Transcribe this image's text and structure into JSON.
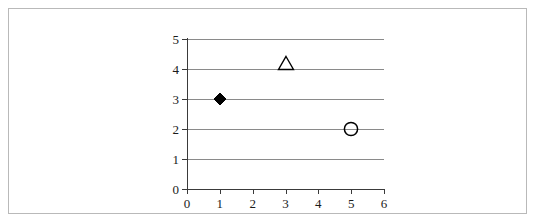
{
  "chart_data": {
    "type": "scatter",
    "title": "",
    "xlabel": "",
    "ylabel": "",
    "xlim": [
      0,
      6
    ],
    "ylim": [
      0,
      5
    ],
    "x_ticks": [
      0,
      1,
      2,
      3,
      4,
      5,
      6
    ],
    "y_ticks": [
      0,
      1,
      2,
      3,
      4,
      5
    ],
    "x_tick_labels": [
      "0",
      "1",
      "2",
      "3",
      "4",
      "5",
      "6"
    ],
    "y_tick_labels": [
      "0",
      "1",
      "2",
      "3",
      "4",
      "5"
    ],
    "grid": {
      "horizontal": true,
      "vertical": false,
      "horizontal_values": [
        1,
        2,
        3,
        4,
        5
      ],
      "color": "#8a8a8a"
    },
    "legend": null,
    "legend_position": "none",
    "axis_color": "#3a3a3a",
    "points": [
      {
        "label": "diamond-point",
        "x": 1,
        "y": 3,
        "marker": "filled-diamond",
        "color": "#000000",
        "filled": true
      },
      {
        "label": "triangle-point",
        "x": 3,
        "y": 4,
        "marker": "open-triangle",
        "color": "#000000",
        "filled": false
      },
      {
        "label": "circle-point",
        "x": 5,
        "y": 2,
        "marker": "open-circle",
        "color": "#000000",
        "filled": false
      }
    ],
    "series": [
      {
        "name": "points",
        "x": [
          1,
          3,
          5
        ],
        "values": [
          3,
          4,
          2
        ]
      }
    ]
  },
  "frame": {
    "border_color": "#b9b9b9",
    "background": "#ffffff"
  }
}
